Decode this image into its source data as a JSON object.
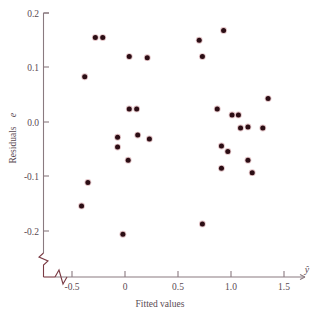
{
  "chart": {
    "type": "scatter",
    "title": "",
    "xlabel": "Fitted values",
    "xaxis_symbol": "ŷ",
    "ylabel_text": "Residuals",
    "ylabel_symbol": "e",
    "point_color": "#2b0d14",
    "axis_color": "#8a7a80",
    "break_color": "#7a3b44",
    "x_ticks": [
      "-0.5",
      "0",
      "0.5",
      "1.0",
      "1.5"
    ],
    "y_ticks": [
      "0.2",
      "0.1",
      "0.0",
      "-0.1",
      "-0.2"
    ]
  },
  "chart_data": {
    "type": "scatter",
    "title": "",
    "xlabel": "Fitted values",
    "ylabel": "Residuals e",
    "xlim": [
      -0.75,
      1.75
    ],
    "ylim": [
      -0.26,
      0.21
    ],
    "xticks": [
      -0.5,
      0,
      0.5,
      1.0,
      1.5
    ],
    "xticklabels": [
      "-0.5",
      "0",
      "0.5",
      "1.0",
      "1.5"
    ],
    "yticks": [
      0.2,
      0.1,
      0.0,
      -0.1,
      -0.2
    ],
    "yticklabels": [
      "0.2",
      "0.1",
      "0.0",
      "-0.1",
      "-0.2"
    ],
    "grid": false,
    "legend": false,
    "axis_break_x": true,
    "axis_break_y": true,
    "n_points": 31,
    "series": [
      {
        "name": "residuals",
        "color": "#2b0d14",
        "marker": "circle",
        "points": [
          {
            "x": -0.28,
            "y": 0.155
          },
          {
            "x": -0.21,
            "y": 0.155
          },
          {
            "x": 0.04,
            "y": 0.12
          },
          {
            "x": 0.21,
            "y": 0.118
          },
          {
            "x": -0.38,
            "y": 0.083
          },
          {
            "x": 0.93,
            "y": 0.168
          },
          {
            "x": 0.7,
            "y": 0.15
          },
          {
            "x": 0.73,
            "y": 0.12
          },
          {
            "x": 0.04,
            "y": 0.024
          },
          {
            "x": 0.11,
            "y": 0.024
          },
          {
            "x": 1.35,
            "y": 0.043
          },
          {
            "x": 0.87,
            "y": 0.024
          },
          {
            "x": 1.01,
            "y": 0.013
          },
          {
            "x": 1.07,
            "y": 0.013
          },
          {
            "x": -0.07,
            "y": -0.028
          },
          {
            "x": -0.07,
            "y": -0.046
          },
          {
            "x": 0.12,
            "y": -0.024
          },
          {
            "x": 0.23,
            "y": -0.031
          },
          {
            "x": 1.09,
            "y": -0.011
          },
          {
            "x": 1.16,
            "y": -0.009
          },
          {
            "x": 1.3,
            "y": -0.011
          },
          {
            "x": 0.03,
            "y": -0.07
          },
          {
            "x": 0.91,
            "y": -0.044
          },
          {
            "x": 0.97,
            "y": -0.054
          },
          {
            "x": -0.35,
            "y": -0.111
          },
          {
            "x": -0.41,
            "y": -0.154
          },
          {
            "x": 1.16,
            "y": -0.07
          },
          {
            "x": 0.91,
            "y": -0.085
          },
          {
            "x": 1.2,
            "y": -0.093
          },
          {
            "x": -0.02,
            "y": -0.206
          },
          {
            "x": 0.73,
            "y": -0.187
          }
        ]
      }
    ]
  }
}
